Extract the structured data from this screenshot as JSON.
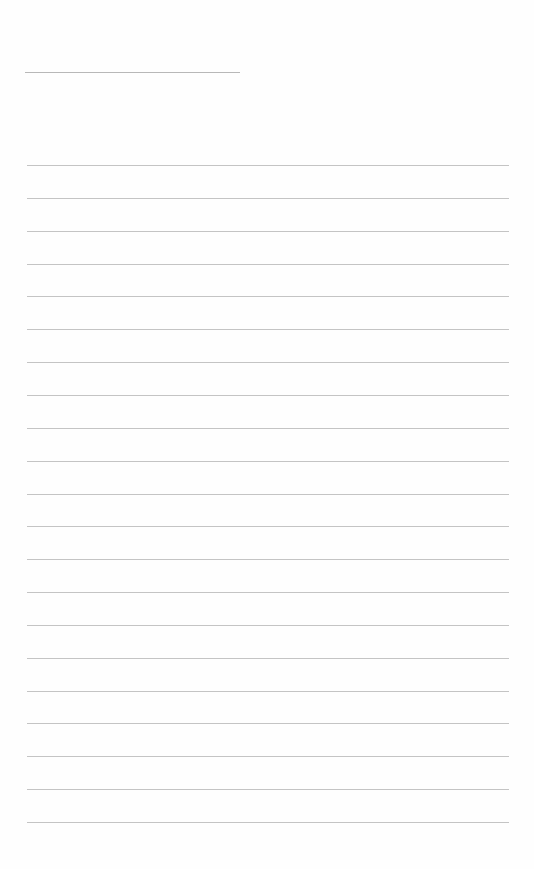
{
  "page": {
    "type": "lined-paper",
    "background": "#fefefe",
    "rule_color": "#c4c4c4",
    "header_line": {
      "left": 25,
      "top": 72,
      "width": 215
    },
    "rules": {
      "count": 21,
      "first_top": 165,
      "spacing": 32.85,
      "left": 27,
      "width": 482
    }
  }
}
